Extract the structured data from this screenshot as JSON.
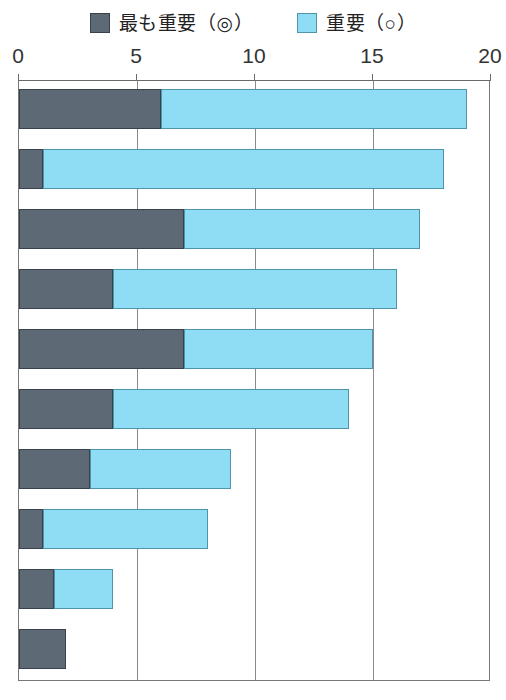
{
  "legend": {
    "items": [
      {
        "label": "最も重要（◎）",
        "color": "#5d6a75",
        "key": "most_important"
      },
      {
        "label": "重要（○）",
        "color": "#8fdcf5",
        "key": "important"
      }
    ]
  },
  "axis": {
    "ticks": [
      "0",
      "5",
      "10",
      "15",
      "20"
    ],
    "min": 0,
    "max": 20
  },
  "chart_data": {
    "type": "bar",
    "orientation": "horizontal",
    "stacked": true,
    "title": "",
    "xlabel": "",
    "ylabel": "",
    "xlim": [
      0,
      20
    ],
    "xticks": [
      0,
      5,
      10,
      15,
      20
    ],
    "grid": true,
    "legend_position": "top-center",
    "categories": [
      "1",
      "2",
      "3",
      "4",
      "5",
      "6",
      "7",
      "8",
      "9",
      "10"
    ],
    "series": [
      {
        "name": "最も重要（◎）",
        "color": "#5d6a75",
        "values": [
          6,
          1,
          7,
          4,
          7,
          4,
          3,
          1,
          1.5,
          2
        ]
      },
      {
        "name": "重要（○）",
        "color": "#8fdcf5",
        "values": [
          13,
          17,
          10,
          12,
          8,
          10,
          6,
          7,
          2.5,
          0
        ]
      }
    ],
    "totals": [
      19,
      18,
      17,
      16,
      15,
      14,
      9,
      8,
      4,
      2
    ]
  }
}
